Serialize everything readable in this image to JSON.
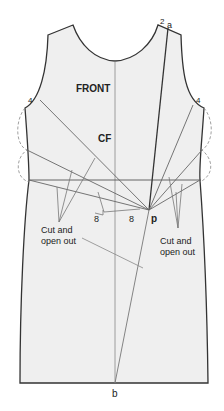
{
  "figure": {
    "title": "FRONT",
    "center_front_label": "CF",
    "point_labels": {
      "shoulder_number": "2",
      "shoulder_point": "a",
      "left_armhole": "4",
      "right_armhole": "4",
      "pivot": "p",
      "hem_point": "b",
      "dart_left": "8",
      "dart_right": "8"
    },
    "annotations": {
      "left_cut": [
        "Cut and",
        "open out"
      ],
      "right_cut": [
        "Cut and",
        "open out"
      ]
    },
    "colors": {
      "fill": "#efefef",
      "outline": "#333333",
      "guide": "#777777",
      "dashed": "#888888"
    }
  }
}
